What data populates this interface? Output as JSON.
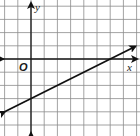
{
  "chart_data": {
    "type": "line",
    "title": "",
    "xlabel": "x",
    "ylabel": "y",
    "origin_label": "O",
    "xlim": [
      -2,
      8
    ],
    "ylim": [
      -5,
      4
    ],
    "grid": true,
    "grid_step": 1,
    "series": [
      {
        "name": "line",
        "equation": "y = 0.5x - 3",
        "slope": 0.5,
        "y_intercept": -3,
        "x_intercept": 6,
        "x": [
          -2,
          7.9
        ],
        "y": [
          -4,
          0.95
        ],
        "arrows": "both"
      }
    ],
    "colors": {
      "grid": "#8c8c8c",
      "axis": "#1a1a1a",
      "line": "#111111"
    }
  }
}
